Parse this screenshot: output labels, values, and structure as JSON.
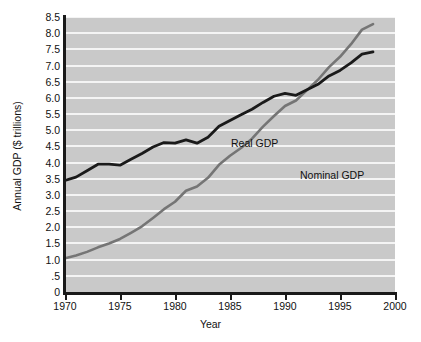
{
  "chart_data": {
    "type": "line",
    "title": "",
    "xlabel": "Year",
    "ylabel": "Annual GDP ($ trillions)",
    "xlim": [
      1970,
      2000
    ],
    "ylim": [
      0,
      8.5
    ],
    "grid": true,
    "legend_position": "inline-annotations",
    "x_ticks": [
      "1970",
      "1975",
      "1980",
      "1985",
      "1990",
      "1995",
      "2000"
    ],
    "x_tick_values": [
      1970,
      1975,
      1980,
      1985,
      1990,
      1995,
      2000
    ],
    "y_ticks": [
      "0",
      ".5",
      "1.0",
      "1.5",
      "2.0",
      "2.5",
      "3.0",
      "3.5",
      "4.0",
      "4.5",
      "5.0",
      "5.5",
      "6.0",
      "6.5",
      "7.0",
      "7.5",
      "8.0",
      "8.5"
    ],
    "y_tick_values": [
      0,
      0.5,
      1.0,
      1.5,
      2.0,
      2.5,
      3.0,
      3.5,
      4.0,
      4.5,
      5.0,
      5.5,
      6.0,
      6.5,
      7.0,
      7.5,
      8.0,
      8.5
    ],
    "colors": {
      "real_gdp": "#1a1a1a",
      "nominal_gdp": "#757575",
      "plot_background": "#c9c9c9",
      "gridline": "#f4f4f4"
    },
    "x": [
      1970,
      1971,
      1972,
      1973,
      1974,
      1975,
      1976,
      1977,
      1978,
      1979,
      1980,
      1981,
      1982,
      1983,
      1984,
      1985,
      1986,
      1987,
      1988,
      1989,
      1990,
      1991,
      1992,
      1993,
      1994,
      1995,
      1996,
      1997,
      1998
    ],
    "series": [
      {
        "name": "Real GDP",
        "color": "#1a1a1a",
        "values": [
          3.45,
          3.55,
          3.75,
          3.95,
          3.95,
          3.92,
          4.1,
          4.28,
          4.48,
          4.62,
          4.6,
          4.7,
          4.6,
          4.78,
          5.12,
          5.3,
          5.48,
          5.65,
          5.86,
          6.05,
          6.14,
          6.08,
          6.25,
          6.42,
          6.68,
          6.85,
          7.08,
          7.35,
          7.42
        ]
      },
      {
        "name": "Nominal GDP",
        "color": "#757575",
        "values": [
          1.04,
          1.13,
          1.24,
          1.38,
          1.5,
          1.64,
          1.83,
          2.03,
          2.29,
          2.56,
          2.79,
          3.13,
          3.26,
          3.53,
          3.93,
          4.21,
          4.45,
          4.74,
          5.11,
          5.44,
          5.75,
          5.92,
          6.24,
          6.56,
          6.95,
          7.27,
          7.66,
          8.11,
          8.28
        ]
      }
    ],
    "annotations": [
      {
        "text": "Real GDP",
        "series": "Real GDP"
      },
      {
        "text": "Nominal GDP",
        "series": "Nominal GDP"
      }
    ]
  }
}
